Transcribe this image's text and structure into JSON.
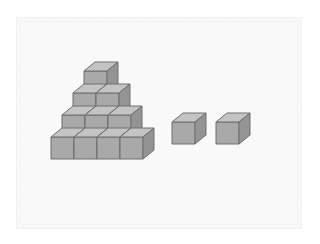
{
  "illustration": {
    "title": "Isometric cube arrangement",
    "description": "A stepped pyramid built from unit cubes beside two loose unit cubes",
    "background_color": "#fafafa",
    "frame_color": "#f2f2f2",
    "page_background": "#ffffff"
  },
  "cube_style": {
    "top_face_color": "#c4c4c4",
    "left_face_color": "#a9a9a9",
    "right_face_color": "#949494",
    "edge_color": "#6e6e6e",
    "edge_width": 1,
    "unit_width": 23,
    "unit_height": 22,
    "depth_x": 11,
    "depth_y": 9
  },
  "groups": [
    {
      "name": "pyramid",
      "label": "Stepped pyramid",
      "total_cubes": 10,
      "rows": [
        {
          "level": 4,
          "count": 1,
          "origin_x": 84,
          "origin_y": 93
        },
        {
          "level": 3,
          "count": 2,
          "origin_x": 73,
          "origin_y": 115
        },
        {
          "level": 2,
          "count": 3,
          "origin_x": 62,
          "origin_y": 137
        },
        {
          "level": 1,
          "count": 4,
          "origin_x": 51,
          "origin_y": 159
        }
      ]
    },
    {
      "name": "loose-cubes",
      "label": "Separate cubes",
      "total_cubes": 2,
      "cubes": [
        {
          "index": 1,
          "origin_x": 172,
          "origin_y": 144
        },
        {
          "index": 2,
          "origin_x": 216,
          "origin_y": 144
        }
      ]
    }
  ],
  "counts": {
    "pyramid_cubes": 10,
    "loose_cubes": 2,
    "total_cubes": 12
  }
}
